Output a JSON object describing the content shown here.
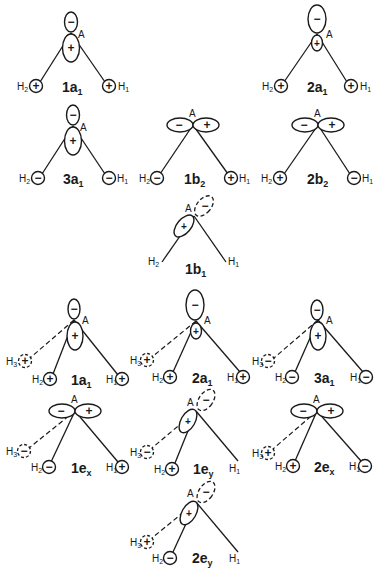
{
  "figure": {
    "atom_center_label": "A",
    "hydrogen_symbol": "H",
    "plus": "+",
    "minus": "−",
    "sections": [
      {
        "name": "AH2 (C2v) orbitals",
        "panels": [
          {
            "label_main": "1a",
            "label_sub": "1",
            "central_orbital": "pz-like (− top, + bottom)",
            "H1": "+",
            "H2": "+"
          },
          {
            "label_main": "2a",
            "label_sub": "1",
            "central_orbital": "pz-like (− top large, + bottom small)",
            "H1": "+",
            "H2": "+"
          },
          {
            "label_main": "3a",
            "label_sub": "1",
            "central_orbital": "pz-like (− top, + bottom)",
            "H1": "−",
            "H2": "−"
          },
          {
            "label_main": "1b",
            "label_sub": "2",
            "central_orbital": "horizontal (− left, + right)",
            "H1": "+",
            "H2": "−"
          },
          {
            "label_main": "2b",
            "label_sub": "2",
            "central_orbital": "horizontal (− left, + right)",
            "H1": "−",
            "H2": "+"
          },
          {
            "label_main": "1b",
            "label_sub": "1",
            "central_orbital": "out-of-plane (+ solid, − dashed)",
            "H1": "",
            "H2": ""
          }
        ]
      },
      {
        "name": "AH3 (C3v) orbitals",
        "panels": [
          {
            "label_main": "1a",
            "label_sub": "1",
            "central_orbital": "− top, + bottom",
            "H1": "+",
            "H2": "+",
            "H3": "+"
          },
          {
            "label_main": "2a",
            "label_sub": "1",
            "central_orbital": "− top large, + bottom small",
            "H1": "+",
            "H2": "+",
            "H3": "+"
          },
          {
            "label_main": "3a",
            "label_sub": "1",
            "central_orbital": "− top, + bottom",
            "H1": "−",
            "H2": "−",
            "H3": "−"
          },
          {
            "label_main": "1e",
            "label_sub": "x",
            "central_orbital": "− left, + right",
            "H1": "+",
            "H2": "−",
            "H3": "−"
          },
          {
            "label_main": "1e",
            "label_sub": "y",
            "central_orbital": "+ solid, − dashed",
            "H1": "",
            "H2": "+",
            "H3": "−"
          },
          {
            "label_main": "2e",
            "label_sub": "x",
            "central_orbital": "− left, + right",
            "H1": "−",
            "H2": "+",
            "H3": "+"
          },
          {
            "label_main": "2e",
            "label_sub": "y",
            "central_orbital": "+ solid, − dashed",
            "H1": "",
            "H2": "−",
            "H3": "+"
          }
        ]
      }
    ]
  }
}
